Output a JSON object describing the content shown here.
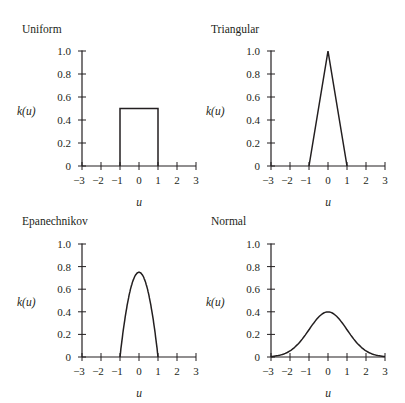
{
  "chart_data": [
    {
      "type": "line",
      "title": "Uniform",
      "xlabel": "u",
      "ylabel": "k(u)",
      "xlim": [
        -3,
        3
      ],
      "ylim": [
        0,
        1.0
      ],
      "xticks": [
        -3,
        -2,
        -1,
        0,
        1,
        2,
        3
      ],
      "xtick_labels": [
        "−3",
        "−2",
        "−1",
        "0",
        "1",
        "2",
        "3"
      ],
      "yticks": [
        0,
        0.2,
        0.4,
        0.6,
        0.8,
        1.0
      ],
      "ytick_labels": [
        "0",
        "0.2",
        "0.4",
        "0.6",
        "0.8",
        "1.0"
      ],
      "grid": false,
      "series": [
        {
          "name": "Uniform",
          "x": [
            -1,
            -1,
            1,
            1
          ],
          "y": [
            0,
            0.5,
            0.5,
            0
          ]
        }
      ]
    },
    {
      "type": "line",
      "title": "Triangular",
      "xlabel": "u",
      "ylabel": "k(u)",
      "xlim": [
        -3,
        3
      ],
      "ylim": [
        0,
        1.0
      ],
      "xticks": [
        -3,
        -2,
        -1,
        0,
        1,
        2,
        3
      ],
      "xtick_labels": [
        "−3",
        "−2",
        "−1",
        "0",
        "1",
        "2",
        "3"
      ],
      "yticks": [
        0,
        0.2,
        0.4,
        0.6,
        0.8,
        1.0
      ],
      "ytick_labels": [
        "0",
        "0.2",
        "0.4",
        "0.6",
        "0.8",
        "1.0"
      ],
      "grid": false,
      "series": [
        {
          "name": "Triangular",
          "x": [
            -1,
            0,
            1
          ],
          "y": [
            0,
            1.0,
            0
          ]
        }
      ]
    },
    {
      "type": "line",
      "title": "Epanechnikov",
      "xlabel": "u",
      "ylabel": "k(u)",
      "xlim": [
        -3,
        3
      ],
      "ylim": [
        0,
        1.0
      ],
      "xticks": [
        -3,
        -2,
        -1,
        0,
        1,
        2,
        3
      ],
      "xtick_labels": [
        "−3",
        "−2",
        "−1",
        "0",
        "1",
        "2",
        "3"
      ],
      "yticks": [
        0,
        0.2,
        0.4,
        0.6,
        0.8,
        1.0
      ],
      "ytick_labels": [
        "0",
        "0.2",
        "0.4",
        "0.6",
        "0.8",
        "1.0"
      ],
      "grid": false,
      "series": [
        {
          "name": "Epanechnikov",
          "x": [
            -1,
            -0.8,
            -0.6,
            -0.4,
            -0.2,
            0,
            0.2,
            0.4,
            0.6,
            0.8,
            1
          ],
          "y": [
            0,
            0.27,
            0.48,
            0.63,
            0.72,
            0.75,
            0.72,
            0.63,
            0.48,
            0.27,
            0
          ]
        }
      ]
    },
    {
      "type": "line",
      "title": "Normal",
      "xlabel": "u",
      "ylabel": "k(u)",
      "xlim": [
        -3,
        3
      ],
      "ylim": [
        0,
        1.0
      ],
      "xticks": [
        -3,
        -2,
        -1,
        0,
        1,
        2,
        3
      ],
      "xtick_labels": [
        "−3",
        "−2",
        "−1",
        "0",
        "1",
        "2",
        "3"
      ],
      "yticks": [
        0,
        0.2,
        0.4,
        0.6,
        0.8,
        1.0
      ],
      "ytick_labels": [
        "0",
        "0.2",
        "0.4",
        "0.6",
        "0.8",
        "1.0"
      ],
      "grid": false,
      "series": [
        {
          "name": "Normal",
          "x": [
            -3,
            -2.5,
            -2,
            -1.5,
            -1,
            -0.5,
            0,
            0.5,
            1,
            1.5,
            2,
            2.5,
            3
          ],
          "y": [
            0.004,
            0.018,
            0.054,
            0.13,
            0.242,
            0.352,
            0.399,
            0.352,
            0.242,
            0.13,
            0.054,
            0.018,
            0.004
          ]
        }
      ]
    }
  ],
  "layout": {
    "panels": [
      {
        "x0": 82,
        "x1": 196,
        "y0": 166,
        "y1": 51,
        "title_x": 22,
        "title_y": 33,
        "ylabel_x": 17,
        "ylabel_y": 115,
        "xlabel_y": 206
      },
      {
        "x0": 271,
        "x1": 385,
        "y0": 166,
        "y1": 51,
        "title_x": 211,
        "title_y": 33,
        "ylabel_x": 206,
        "ylabel_y": 115,
        "xlabel_y": 206
      },
      {
        "x0": 82,
        "x1": 196,
        "y0": 357,
        "y1": 244,
        "title_x": 22,
        "title_y": 225,
        "ylabel_x": 17,
        "ylabel_y": 306,
        "xlabel_y": 397
      },
      {
        "x0": 271,
        "x1": 385,
        "y0": 357,
        "y1": 244,
        "title_x": 211,
        "title_y": 225,
        "ylabel_x": 206,
        "ylabel_y": 306,
        "xlabel_y": 397
      }
    ],
    "stroke_color": "#231f20"
  }
}
